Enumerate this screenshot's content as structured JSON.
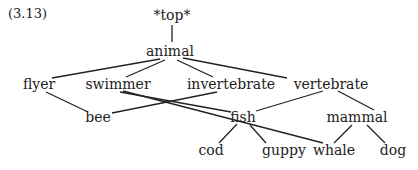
{
  "example_number": "(3.13)",
  "nodes": {
    "top": {
      "label": "*top*",
      "x": 172,
      "y": 15
    },
    "animal": {
      "label": "animal",
      "x": 170,
      "y": 51
    },
    "flyer": {
      "label": "flyer",
      "x": 39,
      "y": 84
    },
    "swimmer": {
      "label": "swimmer",
      "x": 118,
      "y": 84
    },
    "invertebrate": {
      "label": "invertebrate",
      "x": 231,
      "y": 84
    },
    "vertebrate": {
      "label": "vertebrate",
      "x": 331,
      "y": 84
    },
    "bee": {
      "label": "bee",
      "x": 98,
      "y": 117
    },
    "fish": {
      "label": "fish",
      "x": 243,
      "y": 117
    },
    "mammal": {
      "label": "mammal",
      "x": 357,
      "y": 117
    },
    "cod": {
      "label": "cod",
      "x": 211,
      "y": 150
    },
    "guppy": {
      "label": "guppy",
      "x": 284,
      "y": 150
    },
    "whale": {
      "label": "whale",
      "x": 334,
      "y": 150
    },
    "dog": {
      "label": "dog",
      "x": 393,
      "y": 150
    }
  },
  "edges": [
    {
      "from": "top",
      "to": "animal"
    },
    {
      "from": "animal",
      "to": "flyer"
    },
    {
      "from": "animal",
      "to": "swimmer"
    },
    {
      "from": "animal",
      "to": "invertebrate"
    },
    {
      "from": "animal",
      "to": "vertebrate"
    },
    {
      "from": "flyer",
      "to": "bee"
    },
    {
      "from": "swimmer",
      "to": "fish"
    },
    {
      "from": "swimmer",
      "to": "whale"
    },
    {
      "from": "invertebrate",
      "to": "bee"
    },
    {
      "from": "vertebrate",
      "to": "fish"
    },
    {
      "from": "vertebrate",
      "to": "mammal"
    },
    {
      "from": "fish",
      "to": "cod"
    },
    {
      "from": "fish",
      "to": "guppy"
    },
    {
      "from": "mammal",
      "to": "whale"
    },
    {
      "from": "mammal",
      "to": "dog"
    }
  ]
}
